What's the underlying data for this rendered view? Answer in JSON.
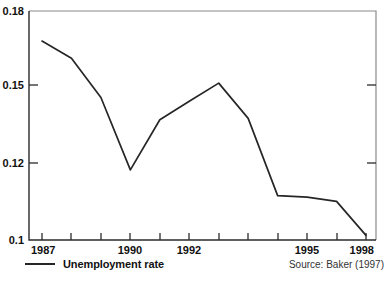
{
  "chart_data": {
    "type": "line",
    "title": "",
    "subtitle": "",
    "xlabel": "",
    "ylabel": "",
    "xlim": [
      1987,
      1998
    ],
    "ylim": [
      0.1,
      0.18
    ],
    "grid": false,
    "legend_position": "bottom-left",
    "x": [
      1987,
      1988,
      1989,
      1990,
      1991,
      1992,
      1993,
      1994,
      1995,
      1996,
      1997,
      1998
    ],
    "series": [
      {
        "name": "Unemployment rate",
        "color": "#262626",
        "values": [
          0.1695,
          0.1635,
          0.1498,
          0.1245,
          0.142,
          0.1485,
          0.1548,
          0.1425,
          0.1155,
          0.115,
          0.1135,
          0.1016
        ]
      }
    ],
    "ytick_labels": [
      "0.18",
      "0.15",
      "0.12",
      "0.1"
    ],
    "ytick_values": [
      0.18,
      0.15,
      0.12,
      0.1
    ],
    "xtick_values": [
      1987,
      1988,
      1989,
      1990,
      1991,
      1992,
      1993,
      1994,
      1995,
      1996,
      1997,
      1998
    ],
    "xtick_labels_shown": [
      "1987",
      "1990",
      "1992",
      "1995",
      "1998"
    ],
    "xtick_labeled_values": [
      1987,
      1990,
      1992,
      1995,
      1998
    ],
    "annotations": {
      "source": "Source: Baker (1997)"
    }
  },
  "legend": {
    "entries": [
      {
        "label": "Unemployment rate"
      }
    ]
  },
  "footer": {
    "source": "Source: Baker (1997)"
  },
  "axis": {
    "y_labels": [
      "0.18",
      "0.15",
      "0.12",
      "0.1"
    ],
    "x_labels": [
      "1987",
      "1990",
      "1992",
      "1995",
      "1998"
    ]
  }
}
